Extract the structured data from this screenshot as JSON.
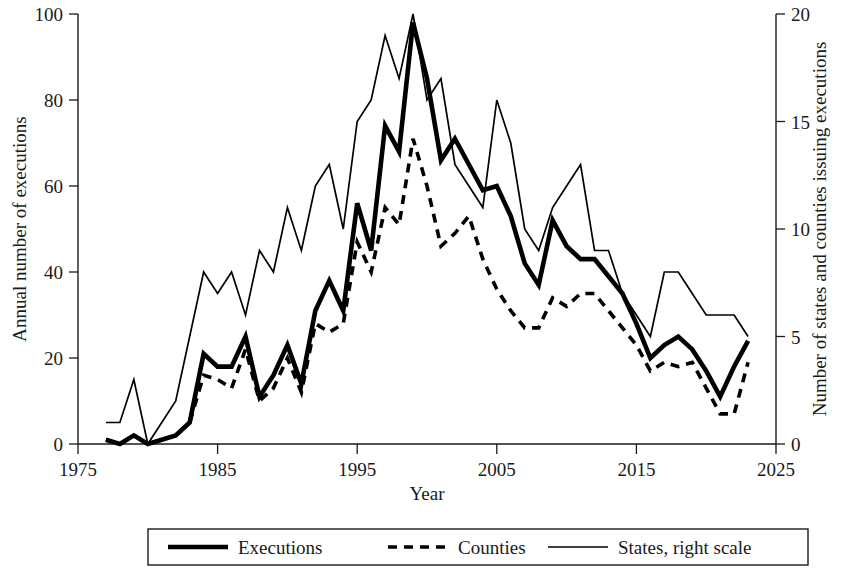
{
  "chart_data": {
    "type": "line",
    "title": "",
    "xlabel": "Year",
    "ylabel": "Annual number of executions",
    "y2label": "Number of states and counties issuing executions",
    "xlim": [
      1975,
      2025
    ],
    "ylim": [
      0,
      100
    ],
    "y2lim": [
      0,
      20
    ],
    "xticks": [
      1975,
      1985,
      1995,
      2005,
      2015,
      2025
    ],
    "yticks": [
      0,
      20,
      40,
      60,
      80,
      100
    ],
    "y2ticks": [
      0,
      5,
      10,
      15,
      20
    ],
    "grid": false,
    "legend_position": "bottom",
    "x": [
      1977,
      1978,
      1979,
      1980,
      1981,
      1982,
      1983,
      1984,
      1985,
      1986,
      1987,
      1988,
      1989,
      1990,
      1991,
      1992,
      1993,
      1994,
      1995,
      1996,
      1997,
      1998,
      1999,
      2000,
      2001,
      2002,
      2003,
      2004,
      2005,
      2006,
      2007,
      2008,
      2009,
      2010,
      2011,
      2012,
      2013,
      2014,
      2015,
      2016,
      2017,
      2018,
      2019,
      2020,
      2021,
      2022,
      2023
    ],
    "series": [
      {
        "name": "Executions",
        "axis": "left",
        "style": "thick-solid",
        "values": [
          1,
          0,
          2,
          0,
          1,
          2,
          5,
          21,
          18,
          18,
          25,
          11,
          16,
          23,
          14,
          31,
          38,
          31,
          56,
          45,
          74,
          68,
          98,
          85,
          66,
          71,
          65,
          59,
          60,
          53,
          42,
          37,
          52,
          46,
          43,
          43,
          39,
          35,
          28,
          20,
          23,
          25,
          22,
          17,
          11,
          18,
          24
        ]
      },
      {
        "name": "Counties",
        "axis": "left",
        "style": "dashed",
        "values": [
          1,
          0,
          2,
          0,
          1,
          2,
          5,
          16,
          15,
          13,
          22,
          10,
          13,
          20,
          12,
          28,
          26,
          28,
          47,
          40,
          55,
          51,
          71,
          60,
          46,
          49,
          53,
          43,
          36,
          31,
          27,
          27,
          34,
          32,
          35,
          35,
          31,
          27,
          23,
          17,
          19,
          18,
          19,
          13,
          7,
          7,
          19
        ]
      },
      {
        "name": "States, right scale",
        "axis": "right",
        "style": "thin-solid",
        "values": [
          1,
          1,
          3,
          0,
          1,
          2,
          5,
          8,
          7,
          8,
          6,
          9,
          8,
          11,
          9,
          12,
          13,
          10,
          15,
          16,
          19,
          17,
          20,
          16,
          17,
          13,
          12,
          11,
          16,
          14,
          10,
          9,
          11,
          12,
          13,
          9,
          9,
          7,
          6,
          5,
          8,
          8,
          7,
          6,
          6,
          6,
          5
        ]
      }
    ]
  },
  "axes": {
    "left": {
      "title": "Annual number of executions",
      "ticks": [
        "0",
        "20",
        "40",
        "60",
        "80",
        "100"
      ]
    },
    "right": {
      "title": "Number of states and counties issuing executions",
      "ticks": [
        "0",
        "5",
        "10",
        "15",
        "20"
      ]
    },
    "bottom": {
      "title": "Year",
      "ticks": [
        "1975",
        "1985",
        "1995",
        "2005",
        "2015",
        "2025"
      ]
    }
  },
  "legend": {
    "items": [
      {
        "label": "Executions",
        "style": "thick-solid"
      },
      {
        "label": "Counties",
        "style": "dashed"
      },
      {
        "label": "States, right scale",
        "style": "thin-solid"
      }
    ]
  },
  "colors": {
    "ink": "#111111",
    "background": "#ffffff"
  }
}
